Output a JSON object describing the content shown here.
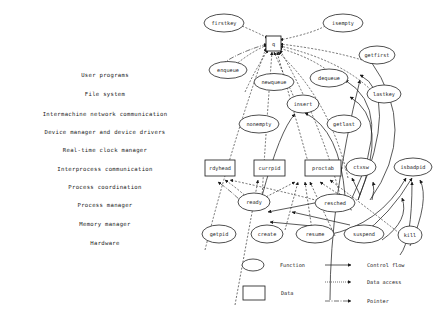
{
  "layers": [
    {
      "label": "User programs",
      "y": 75
    },
    {
      "label": "File system",
      "y": 94
    },
    {
      "label": "Intermachine network communication",
      "y": 114
    },
    {
      "label": "Device manager and device drivers",
      "y": 132
    },
    {
      "label": "Real-time clock manager",
      "y": 150
    },
    {
      "label": "Interprocess communication",
      "y": 169
    },
    {
      "label": "Process coordination",
      "y": 187
    },
    {
      "label": "Process manager",
      "y": 205
    },
    {
      "label": "Memory manager",
      "y": 224
    },
    {
      "label": "Hardware",
      "y": 243
    }
  ],
  "nodes": {
    "q": {
      "label": "q",
      "type": "data"
    },
    "firstkey": {
      "label": "firstkey",
      "type": "function"
    },
    "isempty": {
      "label": "isempty",
      "type": "function"
    },
    "enqueue": {
      "label": "enqueue",
      "type": "function"
    },
    "newqueue": {
      "label": "newqueue",
      "type": "function"
    },
    "getfirst": {
      "label": "getfirst",
      "type": "function"
    },
    "dequeue": {
      "label": "dequeue",
      "type": "function"
    },
    "lastkey": {
      "label": "lastkey",
      "type": "function"
    },
    "insert": {
      "label": "insert",
      "type": "function"
    },
    "nonempty": {
      "label": "nonempty",
      "type": "function"
    },
    "getlast": {
      "label": "getlast",
      "type": "function"
    },
    "rdyhead": {
      "label": "rdyhead",
      "type": "data"
    },
    "currpid": {
      "label": "currpid",
      "type": "data"
    },
    "proctab": {
      "label": "proctab",
      "type": "data"
    },
    "ctxsw": {
      "label": "ctxsw",
      "type": "function"
    },
    "isbadpid": {
      "label": "isbadpid",
      "type": "function"
    },
    "ready": {
      "label": "ready",
      "type": "function"
    },
    "resched": {
      "label": "resched",
      "type": "function"
    },
    "getpid": {
      "label": "getpid",
      "type": "function"
    },
    "create": {
      "label": "create",
      "type": "function"
    },
    "resume": {
      "label": "resume",
      "type": "function"
    },
    "suspend": {
      "label": "suspend",
      "type": "function"
    },
    "kill": {
      "label": "kill",
      "type": "function"
    }
  },
  "legend": {
    "function": "Function",
    "data": "Data",
    "control_flow": "Control flow",
    "data_access": "Data access",
    "pointer": "Pointer"
  }
}
